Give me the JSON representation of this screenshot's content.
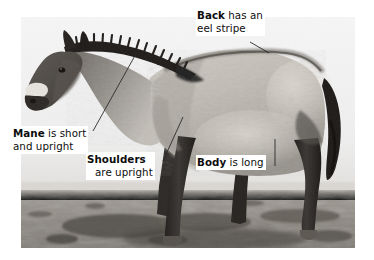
{
  "figure": {
    "name": "przewalski-horse-annotated-photo",
    "background_color": "#ffffff",
    "photo": {
      "style": "black-and-white photograph",
      "left": 21,
      "top": 17,
      "right": 355,
      "bottom": 248,
      "ground_horizon_y": 190,
      "sky_color": "#f2f2f2",
      "ground_color": "#8e8a84",
      "horse_body_color": "#b9b5ae",
      "horse_dark_color": "#2a2724"
    }
  },
  "callouts": [
    {
      "id": "back",
      "name": "callout-back",
      "bold": "Back",
      "line1_rest": " has an",
      "line2": "eel stripe",
      "leader": {
        "x1": 250,
        "y1": 42,
        "x2": 269,
        "y2": 53
      }
    },
    {
      "id": "mane",
      "name": "callout-mane",
      "bold": "Mane",
      "line1_rest": " is short",
      "line2": "and upright",
      "leader": {
        "x1": 93,
        "y1": 131,
        "x2": 137,
        "y2": 52
      }
    },
    {
      "id": "shoulders",
      "name": "callout-shoulders",
      "bold": "Shoulders",
      "line1_rest": "",
      "line2": "are upright",
      "leader": {
        "x1": 163,
        "y1": 161,
        "x2": 183,
        "y2": 117
      }
    },
    {
      "id": "body",
      "name": "callout-body",
      "bold": "Body",
      "line1_rest": " is long",
      "line2": "",
      "leader": {
        "x1": 275,
        "y1": 166,
        "x2": 275,
        "y2": 139
      }
    }
  ],
  "colors": {
    "text": "#0d0d0d",
    "leader_line": "#2b2b2b",
    "page_background": "#ffffff"
  }
}
